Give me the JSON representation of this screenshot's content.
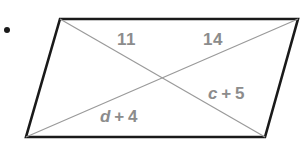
{
  "figure": {
    "name": "parallelogram-with-diagonals",
    "canvas": {
      "width": 307,
      "height": 144,
      "background": "#ffffff"
    },
    "item_marker": ".",
    "colors": {
      "outline": "#1a1a1a",
      "diagonal": "#9a9a9a",
      "label_text": "#8c8c8c",
      "background": "#ffffff"
    },
    "vertices": {
      "top_left": [
        60,
        19
      ],
      "top_right": [
        298,
        19
      ],
      "bottom_right": [
        265,
        137
      ],
      "bottom_left": [
        26,
        137
      ]
    },
    "diagonals": [
      {
        "name": "top-left-to-bottom-right",
        "from": [
          60,
          19
        ],
        "to": [
          265,
          137
        ]
      },
      {
        "name": "top-right-to-bottom-left",
        "from": [
          298,
          19
        ],
        "to": [
          26,
          137
        ]
      }
    ],
    "intersection": [
      162,
      79
    ],
    "labels": {
      "segment_upper_left": "11",
      "segment_upper_right": "14",
      "segment_lower_right": {
        "var": "c",
        "op": "+",
        "num": "5",
        "full": "c + 5"
      },
      "segment_lower_left": {
        "var": "d",
        "op": "+",
        "num": "4",
        "full": "d + 4"
      }
    }
  }
}
